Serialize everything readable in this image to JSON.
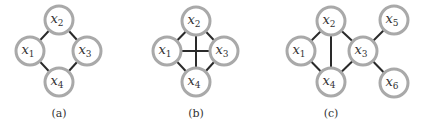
{
  "graphs": [
    {
      "id": "a",
      "caption": "(a)",
      "nodes": [
        {
          "id": "x1",
          "var": "x",
          "sub": "1"
        },
        {
          "id": "x2",
          "var": "x",
          "sub": "2"
        },
        {
          "id": "x3",
          "var": "x",
          "sub": "3"
        },
        {
          "id": "x4",
          "var": "x",
          "sub": "4"
        }
      ],
      "edges": [
        [
          "x1",
          "x2"
        ],
        [
          "x2",
          "x3"
        ],
        [
          "x3",
          "x4"
        ],
        [
          "x4",
          "x1"
        ]
      ]
    },
    {
      "id": "b",
      "caption": "(b)",
      "nodes": [
        {
          "id": "x1",
          "var": "x",
          "sub": "1"
        },
        {
          "id": "x2",
          "var": "x",
          "sub": "2"
        },
        {
          "id": "x3",
          "var": "x",
          "sub": "3"
        },
        {
          "id": "x4",
          "var": "x",
          "sub": "4"
        }
      ],
      "edges": [
        [
          "x1",
          "x2"
        ],
        [
          "x2",
          "x3"
        ],
        [
          "x3",
          "x4"
        ],
        [
          "x4",
          "x1"
        ],
        [
          "x1",
          "x3"
        ],
        [
          "x2",
          "x4"
        ]
      ]
    },
    {
      "id": "c",
      "caption": "(c)",
      "nodes": [
        {
          "id": "x1",
          "var": "x",
          "sub": "1"
        },
        {
          "id": "x2",
          "var": "x",
          "sub": "2"
        },
        {
          "id": "x3",
          "var": "x",
          "sub": "3"
        },
        {
          "id": "x4",
          "var": "x",
          "sub": "4"
        },
        {
          "id": "x5",
          "var": "x",
          "sub": "5"
        },
        {
          "id": "x6",
          "var": "x",
          "sub": "6"
        }
      ],
      "edges": [
        [
          "x1",
          "x2"
        ],
        [
          "x1",
          "x4"
        ],
        [
          "x2",
          "x4"
        ],
        [
          "x2",
          "x3"
        ],
        [
          "x4",
          "x3"
        ],
        [
          "x3",
          "x5"
        ],
        [
          "x3",
          "x6"
        ]
      ]
    }
  ]
}
